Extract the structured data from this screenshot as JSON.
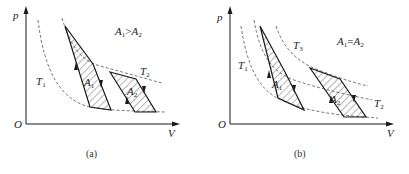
{
  "colors": {
    "line": "#1a1a1a",
    "dashed": "#555555",
    "hatch": "#444444"
  },
  "panels": [
    {
      "id": "a",
      "caption": "(a)",
      "axis_labels": {
        "y": "p",
        "x": "V",
        "origin": "O"
      },
      "relation": {
        "left": "A",
        "left_sub": "1",
        "op": ">",
        "right": "A",
        "right_sub": "2"
      },
      "isotherms": [
        {
          "name": "T",
          "sub": "1",
          "label_x": 36,
          "label_y": 76
        },
        {
          "name": "T",
          "sub": "2",
          "label_x": 140,
          "label_y": 66
        }
      ],
      "regions": [
        {
          "name": "A",
          "sub": "1",
          "label_x": 86,
          "label_y": 78
        },
        {
          "name": "A",
          "sub": "2",
          "label_x": 128,
          "label_y": 86
        }
      ],
      "paths": {
        "iso_T1": "M38,20 C44,70 60,100 90,107 C110,111 140,111 165,112",
        "iso_T2": "M62,18 C70,45 80,60 100,66 C130,74 150,80 162,83",
        "cycle1": "M65,26 L93,64 L111,110 L90,107 Z",
        "cycle2": "M110,72 L136,79 L156,112 L135,112 Z"
      }
    },
    {
      "id": "b",
      "caption": "(b)",
      "axis_labels": {
        "y": "p",
        "x": "V",
        "origin": "O"
      },
      "relation": {
        "left": "A",
        "left_sub": "1",
        "op": "=",
        "right": "A",
        "right_sub": "2"
      },
      "isotherms": [
        {
          "name": "T",
          "sub": "1",
          "label_x": 34,
          "label_y": 60
        },
        {
          "name": "T",
          "sub": "3",
          "label_x": 89,
          "label_y": 40
        },
        {
          "name": "T",
          "sub": "2",
          "label_x": 170,
          "label_y": 100
        }
      ],
      "regions": [
        {
          "name": "A",
          "sub": "1",
          "label_x": 70,
          "label_y": 80
        },
        {
          "name": "A",
          "sub": "2",
          "label_x": 128,
          "label_y": 95
        }
      ],
      "paths": {
        "iso_T1": "M37,26 C42,60 52,85 70,96 C95,112 140,116 174,118",
        "iso_T2": "M50,20 C56,55 68,72 90,80 C120,90 150,96 168,100",
        "iso_T3": "M72,26 C80,50 95,64 120,72 C140,80 155,84 164,86",
        "cycle1": "M56,26 L81,72 L100,110 L74,98 Z",
        "cycle2": "M106,68 L136,79 L162,117 L140,117 Z"
      }
    }
  ]
}
